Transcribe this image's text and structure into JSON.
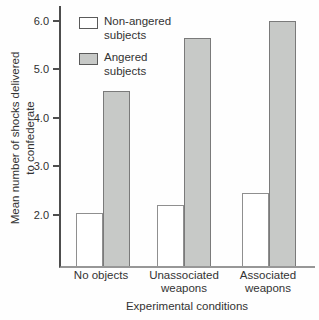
{
  "figure": {
    "ylabel_line1": "Mean number of shocks delivered",
    "ylabel_line2": "to confederate",
    "xlabel": "Experimental conditions"
  },
  "legend": {
    "items": [
      {
        "label": "Non-angered\nsubjects",
        "swatch": "white"
      },
      {
        "label": "Angered\nsubjects",
        "swatch": "gray"
      }
    ]
  },
  "chart_data": {
    "type": "bar",
    "title": "",
    "categories": [
      "No objects",
      "Unassociated\nweapons",
      "Associated\nweapons"
    ],
    "series": [
      {
        "name": "Non-angered subjects",
        "values": [
          2.05,
          2.2,
          2.45
        ],
        "fill": "#ffffff",
        "border": "#8f8f8f"
      },
      {
        "name": "Angered subjects",
        "values": [
          4.55,
          5.65,
          6.0
        ],
        "fill": "#c7c9c7",
        "border": "#7a7a7a"
      }
    ],
    "xlabel": "Experimental conditions",
    "ylabel": "Mean number of shocks delivered to confederate",
    "yticks": [
      "2.0",
      "3.0",
      "4.0",
      "5.0",
      "6.0"
    ],
    "ylim": [
      0.95,
      6.3
    ],
    "grid": false,
    "legend_position": "upper-left-inside"
  },
  "colors": {
    "text": "#333333",
    "y_axis": "#4d4d4d",
    "x_axis": "#979797",
    "angered_fill": "#c7c9c7"
  }
}
